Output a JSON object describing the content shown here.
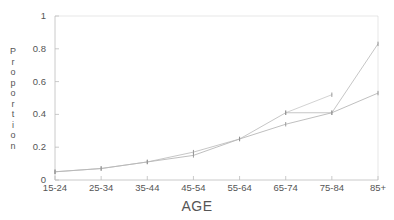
{
  "chart_data": {
    "type": "line",
    "title": "",
    "xlabel": "AGE",
    "ylabel": "Proportion",
    "ylabel_letters": [
      "P",
      "r",
      "o",
      "p",
      "o",
      "r",
      "t",
      "i",
      "o",
      "n"
    ],
    "categories": [
      "15-24",
      "25-34",
      "35-44",
      "45-54",
      "55-64",
      "65-74",
      "75-84",
      "85+"
    ],
    "ytick_labels": [
      "1",
      "0.8",
      "0.6",
      "0.4",
      "0.2",
      "0"
    ],
    "ytick_values": [
      1,
      0.8,
      0.6,
      0.4,
      0.2,
      0
    ],
    "ylim": [
      0,
      1
    ],
    "xlim": [
      0,
      7
    ],
    "grid": false,
    "legend": "none",
    "line_color": "#b8b8b8",
    "axis_color": "#bdbdbd",
    "text_color": "#555555",
    "background": "#ffffff",
    "series": [
      {
        "name": "series-1",
        "values": [
          0.05,
          0.07,
          0.11,
          0.15,
          0.25,
          0.34,
          0.41,
          0.53
        ],
        "marker": "tick"
      },
      {
        "name": "series-2",
        "values": [
          0.05,
          0.07,
          0.11,
          0.17,
          0.25,
          0.41,
          0.41,
          0.83
        ],
        "marker": "tick"
      },
      {
        "name": "series-3",
        "values": [
          null,
          null,
          null,
          null,
          null,
          0.41,
          0.52,
          null
        ],
        "marker": "tick"
      }
    ]
  },
  "axis": {
    "x_title": "AGE",
    "y_title": "Proportion"
  }
}
